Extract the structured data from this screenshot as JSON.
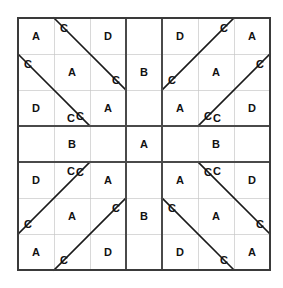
{
  "diagram": {
    "type": "grid-pattern",
    "grid": {
      "rows": 7,
      "cols": 7
    },
    "geometry": {
      "origin_x": 18,
      "origin_y": 18,
      "cell_w": 36,
      "cell_h": 36,
      "width": 252,
      "height": 252
    },
    "colors": {
      "background": "#ffffff",
      "outer_border": "#3a3a3a",
      "block_border": "#4a4a4a",
      "thin_grid": "#c8c8c8",
      "diagonal": "#1a1a1a",
      "letter": "#111111"
    },
    "stroke_widths": {
      "outer_border": 1.6,
      "block_border": 1.4,
      "thin_grid": 0.7,
      "diagonal": 1.6
    },
    "letters": [
      [
        "A",
        "C",
        "D",
        "",
        "D",
        "C",
        "A"
      ],
      [
        "C",
        "A",
        "C",
        "B",
        "C",
        "A",
        "C"
      ],
      [
        "D",
        "C",
        "A",
        "",
        "A",
        "C",
        "D"
      ],
      [
        "",
        "B",
        "",
        "A",
        "",
        "B",
        ""
      ],
      [
        "D",
        "C",
        "A",
        "",
        "A",
        "C",
        "D"
      ],
      [
        "C",
        "A",
        "C",
        "B",
        "C",
        "A",
        "C"
      ],
      [
        "A",
        "C",
        "D",
        "",
        "D",
        "C",
        "A"
      ]
    ],
    "extra_letters": [
      {
        "label": "C",
        "cx": 71,
        "cy": 118,
        "note": "tl-lower-c"
      },
      {
        "label": "C",
        "cx": 217,
        "cy": 118,
        "note": "tr-lower-c"
      },
      {
        "label": "C",
        "cx": 71,
        "cy": 171,
        "note": "bl-upper-c"
      },
      {
        "label": "C",
        "cx": 217,
        "cy": 171,
        "note": "br-upper-c"
      }
    ],
    "diagonals": [
      {
        "x1": 54,
        "y1": 18,
        "x2": 126,
        "y2": 90,
        "block": "top-left"
      },
      {
        "x1": 18,
        "y1": 54,
        "x2": 90,
        "y2": 126,
        "block": "top-left"
      },
      {
        "x1": 234,
        "y1": 18,
        "x2": 162,
        "y2": 90,
        "block": "top-right"
      },
      {
        "x1": 270,
        "y1": 54,
        "x2": 198,
        "y2": 126,
        "block": "top-right"
      },
      {
        "x1": 54,
        "y1": 270,
        "x2": 126,
        "y2": 198,
        "block": "bottom-left"
      },
      {
        "x1": 18,
        "y1": 234,
        "x2": 90,
        "y2": 162,
        "block": "bottom-left"
      },
      {
        "x1": 234,
        "y1": 270,
        "x2": 162,
        "y2": 198,
        "block": "bottom-right"
      },
      {
        "x1": 270,
        "y1": 234,
        "x2": 198,
        "y2": 162,
        "block": "bottom-right"
      }
    ],
    "block_lines": {
      "vertical_x": [
        18,
        126,
        162,
        270
      ],
      "horizontal_y": [
        18,
        126,
        162,
        270
      ]
    },
    "thin_lines": {
      "vertical_x": [
        54,
        90,
        198,
        234
      ],
      "horizontal_y": [
        54,
        90,
        198,
        234
      ]
    },
    "legend": {
      "letters_used": [
        "A",
        "B",
        "C",
        "D"
      ],
      "letter_counts": {
        "A": 13,
        "B": 4,
        "C": 24,
        "D": 8
      }
    }
  }
}
